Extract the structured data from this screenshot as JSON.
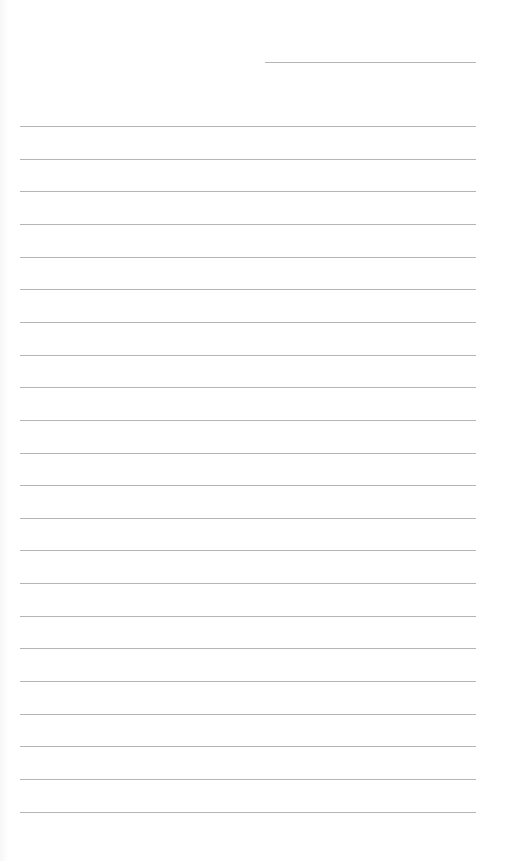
{
  "page": {
    "type": "lined-paper",
    "background_color": "#ffffff",
    "line_color": "#b5b5b5",
    "header_line": {
      "left": 265,
      "top": 62,
      "width": 211
    },
    "ruled_lines": {
      "count": 22,
      "left": 20,
      "width": 456,
      "first_top": 126,
      "spacing": 32.65
    }
  }
}
